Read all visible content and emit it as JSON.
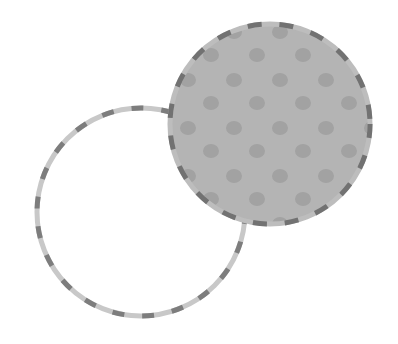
{
  "diagram": {
    "type": "venn",
    "background": "#ffffff",
    "circles": [
      {
        "id": "outline-circle",
        "cx": 141,
        "cy": 212,
        "r": 104,
        "fill": "none",
        "stroke_base": "#c8c8c8",
        "stroke_dash": "#7d7d7d",
        "stroke_width": 5,
        "dash": "12 18"
      },
      {
        "id": "filled-circle",
        "cx": 270,
        "cy": 124,
        "r": 100,
        "fill": "#b4b4b4",
        "dot_color": "#a2a2a2",
        "stroke_base": "#bdbdbd",
        "stroke_dash": "#727272",
        "stroke_width": 5,
        "dash": "14 18"
      }
    ]
  }
}
